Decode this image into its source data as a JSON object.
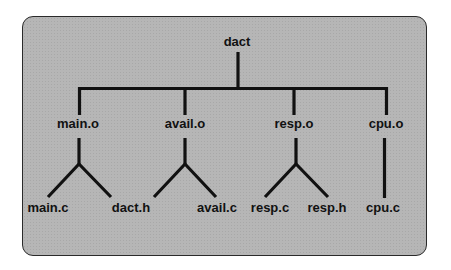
{
  "diagram": {
    "type": "dependency-tree",
    "root": "dact",
    "level1": [
      {
        "label": "main.o",
        "children": [
          "main.c",
          "dact.h"
        ]
      },
      {
        "label": "avail.o",
        "children": [
          "avail.c"
        ]
      },
      {
        "label": "resp.o",
        "children": [
          "resp.c",
          "resp.h"
        ]
      },
      {
        "label": "cpu.o",
        "children": [
          "cpu.c"
        ]
      }
    ],
    "leaves": [
      "main.c",
      "dact.h",
      "avail.c",
      "resp.c",
      "resp.h",
      "cpu.c"
    ],
    "colors": {
      "panel": "#b6b6b6",
      "lines": "#111111",
      "border": "#2a2a2a"
    }
  }
}
